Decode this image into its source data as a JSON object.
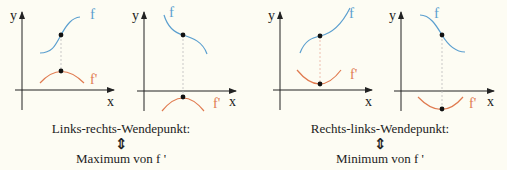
{
  "colors": {
    "background": "#fdfcf3",
    "f_curve": "#5b9fcf",
    "fprime_curve": "#e07a4f",
    "axis": "#222222",
    "dashed": "#bbbbbb",
    "label_f": "#5b9fcf",
    "label_fprime": "#e07a4f"
  },
  "axis_labels": {
    "x": "x",
    "y": "y"
  },
  "curve_labels": {
    "f": "f",
    "fprime": "f'"
  },
  "groups": [
    {
      "title": "Links-rechts-Wendepunkt:",
      "equiv_symbol": "⇕",
      "result": "Maximum von f '"
    },
    {
      "title": "Rechts-links-Wendepunkt:",
      "equiv_symbol": "⇕",
      "result": "Minimum von f '"
    }
  ]
}
